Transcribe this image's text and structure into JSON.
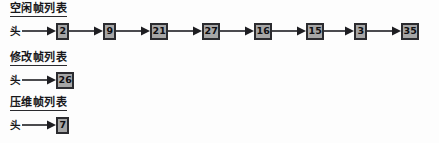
{
  "diagram": {
    "kind": "linked-list-diagram",
    "caption_language": "zh",
    "head_label": "头",
    "arrow_glyph": "→",
    "colors": {
      "page_background": "#fdfdfd",
      "node_fill": "#a6a6a6",
      "node_border": "#2b2b2f",
      "text": "#17171a",
      "arrow": "#1e1e22"
    },
    "lists": [
      {
        "id": "free-frame-list",
        "title": "空闲帧列表",
        "head_label": "头",
        "nodes": [
          "2",
          "9",
          "21",
          "27",
          "16",
          "15",
          "3",
          "35"
        ]
      },
      {
        "id": "modified-frame-list",
        "title": "修改帧列表",
        "head_label": "头",
        "nodes": [
          "26"
        ]
      },
      {
        "id": "compressed-frame-list",
        "title": "压维帧列表",
        "head_label": "头",
        "nodes": [
          "7"
        ]
      }
    ]
  }
}
